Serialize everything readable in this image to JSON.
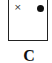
{
  "panel": {
    "label": "C",
    "marks": {
      "cross": "×",
      "dot": "filled-circle"
    }
  },
  "colors": {
    "border": "#222222",
    "mark": "#111111"
  }
}
